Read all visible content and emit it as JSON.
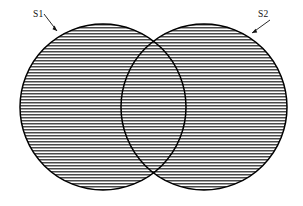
{
  "figure": {
    "type": "venn-diagram",
    "background_color": "#ffffff",
    "outline_color": "#000000",
    "hatch_color": "#3a3a3a",
    "hatch_orientation": "horizontal",
    "hatch_spacing_px": 3,
    "labels": [
      {
        "id": "s1",
        "text": "S1",
        "x": 33,
        "y": 17,
        "leader_from_x": 44,
        "leader_from_y": 14,
        "leader_to_x": 57,
        "leader_to_y": 31
      },
      {
        "id": "s2",
        "text": "S2",
        "x": 258,
        "y": 17,
        "leader_from_x": 270,
        "leader_from_y": 20,
        "leader_to_x": 252,
        "leader_to_y": 33
      }
    ],
    "circles": [
      {
        "id": "s1-circle",
        "name": "left-circle",
        "cx": 103,
        "cy": 107,
        "r": 83
      },
      {
        "id": "s2-circle",
        "name": "right-circle",
        "cx": 204,
        "cy": 107,
        "r": 83
      }
    ]
  }
}
